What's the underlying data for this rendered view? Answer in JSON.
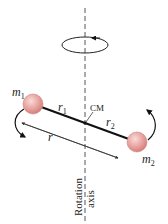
{
  "diagram": {
    "labels": {
      "m1": "m",
      "m1_sub": "1",
      "m2": "m",
      "m2_sub": "2",
      "r1": "r",
      "r1_sub": "1",
      "r2": "r",
      "r2_sub": "2",
      "r": "r",
      "cm": "CM",
      "axis_line1": "Rotation",
      "axis_line2": "axis"
    },
    "colors": {
      "mass": "#e8a0a0",
      "mass_highlight": "#f6d3d0",
      "rod": "#111111",
      "axis": "#555555"
    }
  }
}
